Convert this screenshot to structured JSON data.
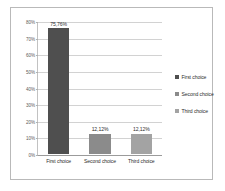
{
  "chart_data": {
    "type": "bar",
    "title": "",
    "subtitle": "",
    "xlabel": "",
    "ylabel": "",
    "categories": [
      "First choice",
      "Second choice",
      "Third choice"
    ],
    "values": [
      75.76,
      12.12,
      12.12
    ],
    "data_labels": [
      "75,76%",
      "12,12%",
      "12,12%"
    ],
    "ylim": [
      0,
      80
    ],
    "yticks": [
      0,
      10,
      20,
      30,
      40,
      50,
      60,
      70,
      80
    ],
    "ytick_labels": [
      "0%",
      "10%",
      "20%",
      "30%",
      "40%",
      "50%",
      "60%",
      "70%",
      "80%"
    ],
    "grid": "horizontal",
    "legend_position": "right",
    "series": [
      {
        "name": "First choice",
        "value": 75.76,
        "label": "75,76%",
        "color": "#4f4f4f"
      },
      {
        "name": "Second choice",
        "value": 12.12,
        "label": "12,12%",
        "color": "#8b8b8b"
      },
      {
        "name": "Third choice",
        "value": 12.12,
        "label": "12,12%",
        "color": "#a3a3a3"
      }
    ],
    "legend": [
      {
        "label": "First choice",
        "color": "#4f4f4f"
      },
      {
        "label": "Second choice",
        "color": "#8b8b8b"
      },
      {
        "label": "Third choice",
        "color": "#a3a3a3"
      }
    ],
    "colors": {
      "first_choice": "#4f4f4f",
      "second_choice": "#8b8b8b",
      "third_choice": "#a3a3a3",
      "gridline": "#d2d2d2",
      "axis": "#9b9b9b",
      "border": "#b9b9b9",
      "background": "#ffffff",
      "tick_text": "#5a5a5a",
      "label_text": "#2e2e2e"
    }
  }
}
